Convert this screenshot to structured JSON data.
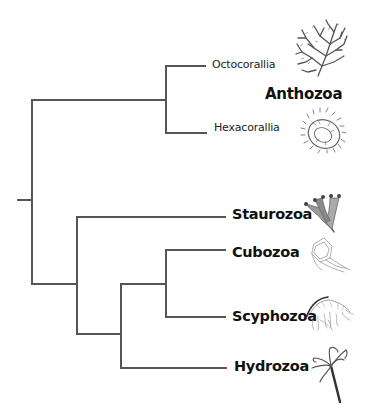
{
  "diagram": {
    "type": "phylogenetic-tree",
    "style": {
      "line_color": "#555555",
      "line_width": 2,
      "background": "#ffffff"
    },
    "root": {
      "label": "Cnidaria (root)"
    },
    "clades": [
      {
        "id": "anthozoa",
        "label": "Anthozoa",
        "children": [
          "Octocorallia",
          "Hexacorallia"
        ]
      },
      {
        "id": "medusozoa",
        "children": [
          "Staurozoa",
          "Cubozoa",
          "Scyphozoa",
          "Hydrozoa"
        ]
      }
    ],
    "labels": {
      "octocorallia": "Octocorallia",
      "anthozoa": "Anthozoa",
      "hexacorallia": "Hexacorallia",
      "staurozoa": "Staurozoa",
      "cubozoa": "Cubozoa",
      "scyphozoa": "Scyphozoa",
      "hydrozoa": "Hydrozoa"
    },
    "icons": {
      "octocorallia": "sea-fan-coral-icon",
      "hexacorallia": "sea-anemone-icon",
      "staurozoa": "stalked-jellyfish-icon",
      "cubozoa": "box-jellyfish-icon",
      "scyphozoa": "true-jellyfish-icon",
      "hydrozoa": "hydra-icon"
    },
    "newick": "((Octocorallia,Hexacorallia)Anthozoa,(Staurozoa,((Cubozoa,Scyphozoa),Hydrozoa)));"
  }
}
